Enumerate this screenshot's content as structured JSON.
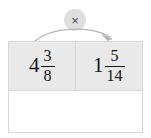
{
  "operation": {
    "symbol": "×",
    "name": "multiply",
    "badge_color": "#dedede",
    "arrow_color": "#b3b3b3"
  },
  "table": {
    "background": "#ffffff",
    "operand_row_background": "#e9e9e9",
    "border_color": "#d8d8d8",
    "operands": [
      {
        "position": "left",
        "whole": "4",
        "numerator": "3",
        "denominator": "8"
      },
      {
        "position": "right",
        "whole": "1",
        "numerator": "5",
        "denominator": "14"
      }
    ],
    "answer": {
      "value": "",
      "placeholder": ""
    }
  }
}
